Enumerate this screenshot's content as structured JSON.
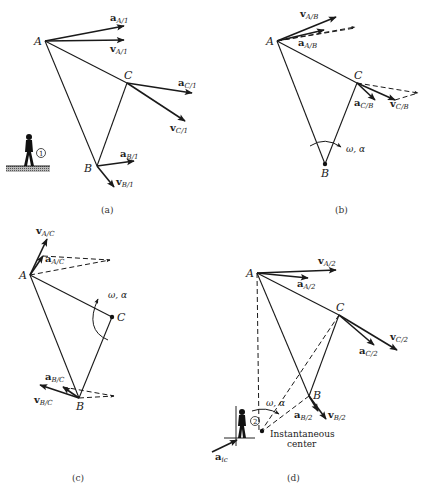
{
  "panels": {
    "a": {
      "caption": "(a)",
      "points": {
        "A": "A",
        "B": "B",
        "C": "C"
      },
      "observer_label": "1",
      "vectors": [
        {
          "sym": "a",
          "sub": "A/1"
        },
        {
          "sym": "v",
          "sub": "A/1"
        },
        {
          "sym": "a",
          "sub": "C/1"
        },
        {
          "sym": "v",
          "sub": "C/1"
        },
        {
          "sym": "a",
          "sub": "B/1"
        },
        {
          "sym": "v",
          "sub": "B/1"
        }
      ]
    },
    "b": {
      "caption": "(b)",
      "points": {
        "A": "A",
        "B": "B",
        "C": "C"
      },
      "rotation_label": "ω, α",
      "vectors": [
        {
          "sym": "v",
          "sub": "A/B"
        },
        {
          "sym": "a",
          "sub": "A/B"
        },
        {
          "sym": "a",
          "sub": "C/B"
        },
        {
          "sym": "v",
          "sub": "C/B"
        }
      ]
    },
    "c": {
      "caption": "(c)",
      "points": {
        "A": "A",
        "B": "B",
        "C": "C"
      },
      "rotation_label": "ω, α",
      "vectors": [
        {
          "sym": "v",
          "sub": "A/C"
        },
        {
          "sym": "a",
          "sub": "A/C"
        },
        {
          "sym": "a",
          "sub": "B/C"
        },
        {
          "sym": "v",
          "sub": "B/C"
        }
      ]
    },
    "d": {
      "caption": "(d)",
      "points": {
        "A": "A",
        "B": "B",
        "C": "C"
      },
      "observer_label": "2",
      "rotation_label": "ω, α",
      "ic_label_line1": "Instantaneous",
      "ic_label_line2": "center",
      "vectors": [
        {
          "sym": "v",
          "sub": "A/2"
        },
        {
          "sym": "a",
          "sub": "A/2"
        },
        {
          "sym": "v",
          "sub": "C/2"
        },
        {
          "sym": "a",
          "sub": "C/2"
        },
        {
          "sym": "a",
          "sub": "B/2"
        },
        {
          "sym": "v",
          "sub": "B/2"
        },
        {
          "sym": "a",
          "sub": "ic"
        }
      ]
    }
  }
}
